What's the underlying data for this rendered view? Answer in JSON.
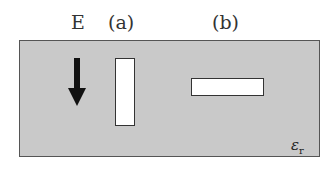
{
  "diagram": {
    "field_label": "E",
    "field_direction": "down",
    "cavity_a_label": "(a)",
    "cavity_b_label": "(b)",
    "medium_symbol": "ε",
    "medium_subscript": "r",
    "colors": {
      "slab": "#c9c9c9",
      "cavity": "#ffffff",
      "arrow": "#111111"
    }
  }
}
